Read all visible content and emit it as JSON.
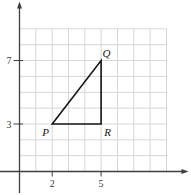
{
  "figure": {
    "colors": {
      "grid": "#d6d6d6",
      "axis": "#3f3f3f",
      "shape": "#161616",
      "text": "#3a3a3a",
      "partial_text": "#8f8f8f"
    },
    "grid": {
      "x_min": 0,
      "x_max": 9,
      "y_min": 0,
      "y_max": 9
    },
    "x_axis": {
      "ticks": [
        {
          "value": 2,
          "label": "2"
        },
        {
          "value": 5,
          "label": "5"
        }
      ]
    },
    "y_axis": {
      "partial_label": "y",
      "ticks": [
        {
          "value": 3,
          "label": "3"
        },
        {
          "value": 7,
          "label": "7"
        }
      ]
    },
    "triangle": {
      "name": "PQR",
      "vertices": [
        {
          "name": "P",
          "x": 2,
          "y": 3,
          "label_pos": "below-left"
        },
        {
          "name": "Q",
          "x": 5,
          "y": 7,
          "label_pos": "above-right"
        },
        {
          "name": "R",
          "x": 5,
          "y": 3,
          "label_pos": "below-right"
        }
      ]
    }
  }
}
